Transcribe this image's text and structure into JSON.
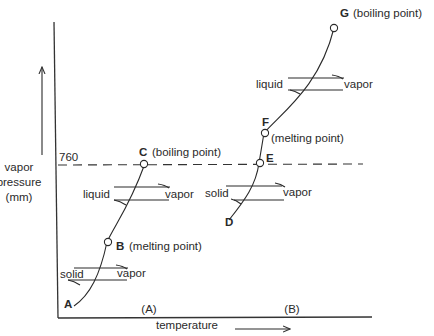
{
  "diagram": {
    "y_axis_label": [
      "vapor",
      "pressure",
      "(mm)"
    ],
    "x_axis_label": "temperature",
    "reference_line_value": "760",
    "panels": [
      {
        "id": "A",
        "label": "(A)",
        "points": [
          {
            "letter": "A",
            "note": ""
          },
          {
            "letter": "B",
            "note": "(melting point)"
          },
          {
            "letter": "C",
            "note": "(boiling point)"
          }
        ],
        "equilibria": [
          {
            "left": "solid",
            "right": "vapor"
          },
          {
            "left": "liquid",
            "right": "vapor"
          }
        ]
      },
      {
        "id": "B",
        "label": "(B)",
        "points": [
          {
            "letter": "D",
            "note": ""
          },
          {
            "letter": "E",
            "note": ""
          },
          {
            "letter": "F",
            "note": "(melting point)"
          },
          {
            "letter": "G",
            "note": "(boiling point)"
          }
        ],
        "equilibria": [
          {
            "left": "solid",
            "right": "vapor"
          },
          {
            "left": "liquid",
            "right": "vapor"
          }
        ]
      }
    ]
  }
}
